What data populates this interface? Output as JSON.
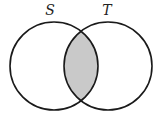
{
  "diagram": {
    "type": "venn",
    "sets": [
      {
        "label": "S",
        "cx": 54,
        "cy": 66,
        "r": 44,
        "label_x": 50,
        "label_y": 15
      },
      {
        "label": "T",
        "cx": 108,
        "cy": 66,
        "r": 44,
        "label_x": 107,
        "label_y": 15
      }
    ],
    "shaded_region": "S ∩ T",
    "colors": {
      "stroke": "#1a1a1a",
      "shade": "#c9c9c9",
      "background": "#ffffff"
    }
  }
}
